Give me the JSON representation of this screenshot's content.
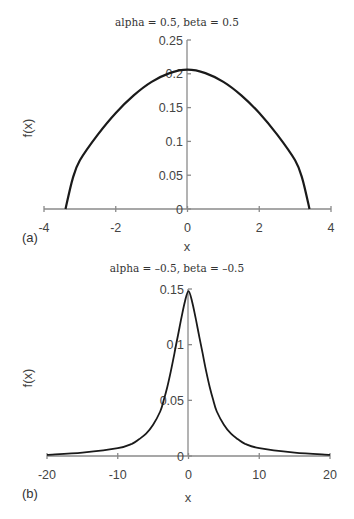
{
  "chart_data": [
    {
      "panel": "(a)",
      "type": "line",
      "title": "alpha = 0.5, beta = 0.5",
      "xlabel": "x",
      "ylabel": "f(x)",
      "xlim": [
        -4,
        4
      ],
      "ylim": [
        0,
        0.25
      ],
      "xticks": [
        "-4",
        "-2",
        "0",
        "2",
        "4"
      ],
      "yticks": [
        "0",
        "0.05",
        "0.1",
        "0.15",
        "0.2",
        "0.25"
      ],
      "grid": false,
      "x": [
        -3.4,
        -3.2,
        -3.0,
        -2.5,
        -2.0,
        -1.5,
        -1.0,
        -0.5,
        0,
        0.5,
        1.0,
        1.5,
        2.0,
        2.5,
        3.0,
        3.2,
        3.4
      ],
      "values": [
        0.0,
        0.045,
        0.072,
        0.11,
        0.142,
        0.168,
        0.188,
        0.201,
        0.206,
        0.201,
        0.188,
        0.168,
        0.142,
        0.11,
        0.072,
        0.045,
        0.0
      ]
    },
    {
      "panel": "(b)",
      "type": "line",
      "title": "alpha = –0.5, beta = –0.5",
      "xlabel": "x",
      "ylabel": "f(x)",
      "xlim": [
        -20,
        20
      ],
      "ylim": [
        0,
        0.15
      ],
      "xticks": [
        "-20",
        "-10",
        "0",
        "10",
        "20"
      ],
      "yticks": [
        "0",
        "0.05",
        "0.1",
        "0.15"
      ],
      "grid": false,
      "x": [
        -20,
        -15,
        -10,
        -8,
        -7,
        -6,
        -5,
        -4,
        -3.5,
        -3,
        -2.5,
        -2,
        -1.5,
        -1,
        -0.5,
        0,
        0.5,
        1,
        1.5,
        2,
        2.5,
        3,
        3.5,
        4,
        5,
        6,
        7,
        8,
        10,
        15,
        20
      ],
      "values": [
        0.001,
        0.003,
        0.007,
        0.011,
        0.015,
        0.02,
        0.028,
        0.04,
        0.05,
        0.062,
        0.076,
        0.092,
        0.108,
        0.124,
        0.139,
        0.148,
        0.139,
        0.124,
        0.108,
        0.092,
        0.076,
        0.062,
        0.05,
        0.04,
        0.028,
        0.02,
        0.015,
        0.011,
        0.007,
        0.003,
        0.001
      ]
    }
  ],
  "labels": {
    "a_title": "alpha = 0.5, beta = 0.5",
    "b_title": "alpha = –0.5, beta = –0.5",
    "a_panel": "(a)",
    "b_panel": "(b)",
    "xlabel": "x",
    "ylabel": "f(x)",
    "a_xticks": [
      "-4",
      "-2",
      "0",
      "2",
      "4"
    ],
    "a_yticks": [
      "0",
      "0.05",
      "0.1",
      "0.15",
      "0.2",
      "0.25"
    ],
    "b_xticks": [
      "-20",
      "-10",
      "0",
      "10",
      "20"
    ],
    "b_yticks": [
      "0",
      "0.05",
      "0.1",
      "0.15"
    ]
  }
}
